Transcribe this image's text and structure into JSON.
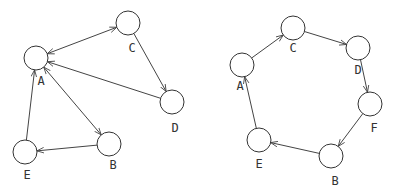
{
  "graphs": [
    {
      "name": "left-graph",
      "nodes": [
        {
          "id": "A",
          "x": 36,
          "y": 58,
          "lx": 41,
          "ly": 81
        },
        {
          "id": "C",
          "x": 128,
          "y": 23,
          "lx": 132,
          "ly": 48
        },
        {
          "id": "D",
          "x": 172,
          "y": 102,
          "lx": 175,
          "ly": 128
        },
        {
          "id": "B",
          "x": 109,
          "y": 144,
          "lx": 113,
          "ly": 165
        },
        {
          "id": "E",
          "x": 25,
          "y": 152,
          "lx": 27,
          "ly": 175
        }
      ],
      "edges": [
        {
          "from": "A",
          "to": "C",
          "bidirectional": true
        },
        {
          "from": "C",
          "to": "D",
          "bidirectional": false
        },
        {
          "from": "D",
          "to": "A",
          "bidirectional": false
        },
        {
          "from": "A",
          "to": "B",
          "bidirectional": true
        },
        {
          "from": "B",
          "to": "E",
          "bidirectional": false
        },
        {
          "from": "E",
          "to": "A",
          "bidirectional": false
        }
      ]
    },
    {
      "name": "right-graph",
      "nodes": [
        {
          "id": "A",
          "x": 242,
          "y": 65,
          "lx": 240,
          "ly": 86
        },
        {
          "id": "C",
          "x": 293,
          "y": 28,
          "lx": 293,
          "ly": 48
        },
        {
          "id": "D",
          "x": 358,
          "y": 48,
          "lx": 358,
          "ly": 70
        },
        {
          "id": "F",
          "x": 370,
          "y": 104,
          "lx": 374,
          "ly": 128
        },
        {
          "id": "B",
          "x": 331,
          "y": 156,
          "lx": 335,
          "ly": 181
        },
        {
          "id": "E",
          "x": 259,
          "y": 140,
          "lx": 259,
          "ly": 164
        }
      ],
      "edges": [
        {
          "from": "A",
          "to": "C",
          "bidirectional": false
        },
        {
          "from": "C",
          "to": "D",
          "bidirectional": false
        },
        {
          "from": "D",
          "to": "F",
          "bidirectional": false
        },
        {
          "from": "F",
          "to": "B",
          "bidirectional": false
        },
        {
          "from": "B",
          "to": "E",
          "bidirectional": false
        },
        {
          "from": "E",
          "to": "A",
          "bidirectional": false
        }
      ]
    }
  ],
  "style": {
    "node_radius": 12,
    "stroke": "#333333"
  }
}
